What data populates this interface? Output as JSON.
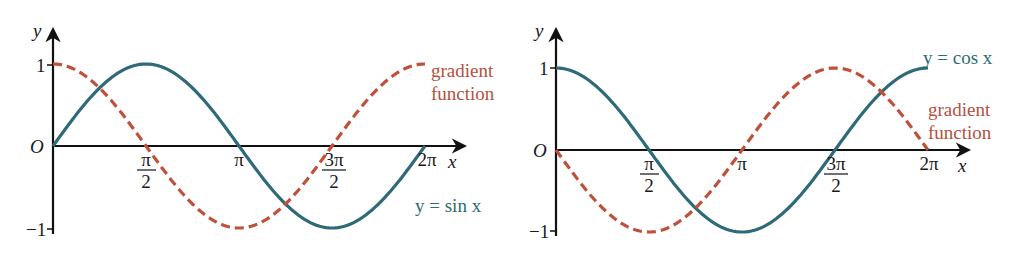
{
  "colors": {
    "curve": "#2e6a78",
    "gradient": "#c0503a",
    "axis": "#111111"
  },
  "left": {
    "ylabel": "y",
    "xlabel": "x",
    "origin": "O",
    "yticks": [
      "1",
      "−1"
    ],
    "xticks": [
      {
        "num": "π",
        "den": "2"
      },
      {
        "num": "π",
        "den": ""
      },
      {
        "num": "3π",
        "den": "2"
      },
      {
        "num": "2π",
        "den": ""
      }
    ],
    "curve_label": "y = sin x",
    "gradient_label_1": "gradient",
    "gradient_label_2": "function"
  },
  "right": {
    "ylabel": "y",
    "xlabel": "x",
    "origin": "O",
    "yticks": [
      "1",
      "−1"
    ],
    "xticks": [
      {
        "num": "π",
        "den": "2"
      },
      {
        "num": "π",
        "den": ""
      },
      {
        "num": "3π",
        "den": "2"
      },
      {
        "num": "2π",
        "den": ""
      }
    ],
    "curve_label": "y = cos x",
    "gradient_label_1": "gradient",
    "gradient_label_2": "function"
  },
  "chart_data": [
    {
      "type": "line",
      "title": "y = sin x and its gradient function",
      "xlabel": "x",
      "ylabel": "y",
      "x_tick_labels": [
        "0",
        "π/2",
        "π",
        "3π/2",
        "2π"
      ],
      "x": [
        0,
        0.7854,
        1.5708,
        2.3562,
        3.1416,
        3.927,
        4.7124,
        5.4978,
        6.2832
      ],
      "xlim": [
        0,
        6.2832
      ],
      "ylim": [
        -1,
        1
      ],
      "series": [
        {
          "name": "y = sin x",
          "style": "solid",
          "color": "#2e6a78",
          "values": [
            0,
            0.707,
            1,
            0.707,
            0,
            -0.707,
            -1,
            -0.707,
            0
          ]
        },
        {
          "name": "gradient function (cos x)",
          "style": "dashed",
          "color": "#c0503a",
          "values": [
            1,
            0.707,
            0,
            -0.707,
            -1,
            -0.707,
            0,
            0.707,
            1
          ]
        }
      ],
      "grid": false
    },
    {
      "type": "line",
      "title": "y = cos x and its gradient function",
      "xlabel": "x",
      "ylabel": "y",
      "x_tick_labels": [
        "0",
        "π/2",
        "π",
        "3π/2",
        "2π"
      ],
      "x": [
        0,
        0.7854,
        1.5708,
        2.3562,
        3.1416,
        3.927,
        4.7124,
        5.4978,
        6.2832
      ],
      "xlim": [
        0,
        6.2832
      ],
      "ylim": [
        -1,
        1
      ],
      "series": [
        {
          "name": "y = cos x",
          "style": "solid",
          "color": "#2e6a78",
          "values": [
            1,
            0.707,
            0,
            -0.707,
            -1,
            -0.707,
            0,
            0.707,
            1
          ]
        },
        {
          "name": "gradient function (−sin x)",
          "style": "dashed",
          "color": "#c0503a",
          "values": [
            0,
            -0.707,
            -1,
            -0.707,
            0,
            0.707,
            1,
            0.707,
            0
          ]
        }
      ],
      "grid": false
    }
  ]
}
